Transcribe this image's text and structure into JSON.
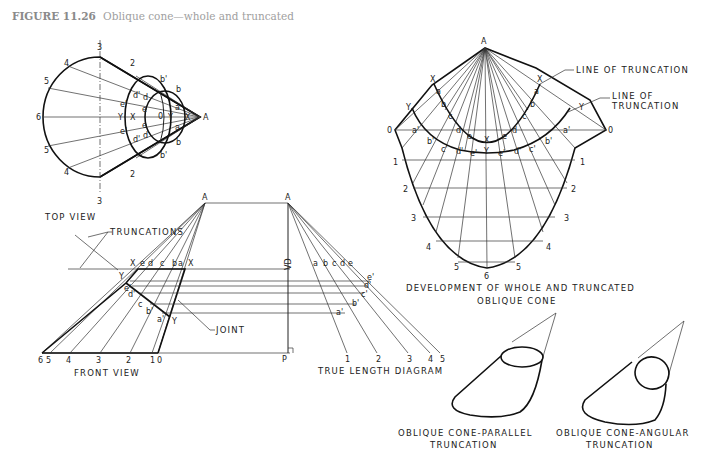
{
  "figure": {
    "number": "FIGURE 11.26",
    "title": "Oblique cone—whole and truncated"
  },
  "top_view": {
    "caption": "TOP VIEW",
    "apex_label": "A",
    "outer_points": [
      "1",
      "2",
      "3",
      "4",
      "5",
      "6",
      "5",
      "4",
      "3",
      "2",
      "1"
    ],
    "inner_labels": [
      "a",
      "b",
      "c",
      "d",
      "e",
      "a'",
      "b'",
      "c'",
      "d'",
      "e'",
      "X",
      "Y",
      "0"
    ]
  },
  "front_view": {
    "caption": "FRONT VIEW",
    "apex_label": "A",
    "truncations_label": "TRUNCATIONS",
    "joint_label": "JOINT",
    "top_labels": [
      "X",
      "e",
      "d",
      "c",
      "b",
      "a",
      "X"
    ],
    "slant_labels": [
      "Y",
      "e'",
      "d'",
      "c'",
      "b'",
      "a'",
      "Y"
    ],
    "base_numbers": [
      "6",
      "5",
      "4",
      "3",
      "2",
      "1",
      "0"
    ]
  },
  "true_length_diagram": {
    "caption": "TRUE LENGTH DIAGRAM",
    "apex_label": "A",
    "vd_label": "VD",
    "foot_label": "P",
    "top_labels": [
      "a",
      "b",
      "c",
      "d",
      "e"
    ],
    "primed_labels": [
      "a'",
      "b'",
      "c'",
      "d'",
      "e'"
    ],
    "base_numbers": [
      "1",
      "2",
      "3",
      "4",
      "5"
    ]
  },
  "development": {
    "caption_line1": "DEVELOPMENT OF WHOLE AND TRUNCATED",
    "caption_line2": "OBLIQUE CONE",
    "apex_label": "A",
    "line_of_truncation_1": "LINE OF TRUNCATION",
    "line_of_truncation_2a": "LINE OF",
    "line_of_truncation_2b": "TRUNCATION",
    "left_numbers": [
      "0",
      "1",
      "2",
      "3",
      "4",
      "5"
    ],
    "bottom_number": "6",
    "right_numbers": [
      "0",
      "1",
      "2",
      "3",
      "4",
      "5"
    ],
    "inner_curve_labels": [
      "X",
      "a",
      "b",
      "c",
      "d",
      "e",
      "X",
      "e",
      "d",
      "c",
      "b",
      "a",
      "X"
    ],
    "outer_curve_labels": [
      "Y",
      "a'",
      "b'",
      "c'",
      "d'",
      "e'",
      "Y",
      "e'",
      "d'",
      "c'",
      "b'",
      "a'",
      "Y"
    ]
  },
  "pictorials": [
    {
      "caption_line1": "OBLIQUE CONE-PARALLEL",
      "caption_line2": "TRUNCATION"
    },
    {
      "caption_line1": "OBLIQUE CONE-ANGULAR",
      "caption_line2": "TRUNCATION"
    }
  ]
}
